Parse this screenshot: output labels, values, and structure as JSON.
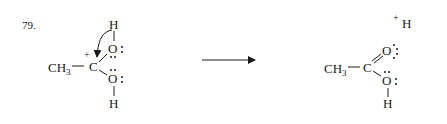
{
  "problem_number": "79.",
  "reactant": {
    "methyl": "CH",
    "methyl_sub": "3",
    "carbon": "C",
    "carbon_charge": "+",
    "top_oxygen": "O",
    "top_hydrogen": "H",
    "bottom_oxygen": "O",
    "bottom_hydrogen": "H"
  },
  "reaction_arrow": "right-arrow",
  "product": {
    "methyl": "CH",
    "methyl_sub": "3",
    "carbon": "C",
    "carbonyl_oxygen": "O",
    "hydroxyl_oxygen": "O",
    "hydroxyl_hydrogen": "H",
    "proton_charge": "+",
    "proton": "H"
  },
  "colors": {
    "ink": "#1a1a1a",
    "background": "#ffffff"
  }
}
